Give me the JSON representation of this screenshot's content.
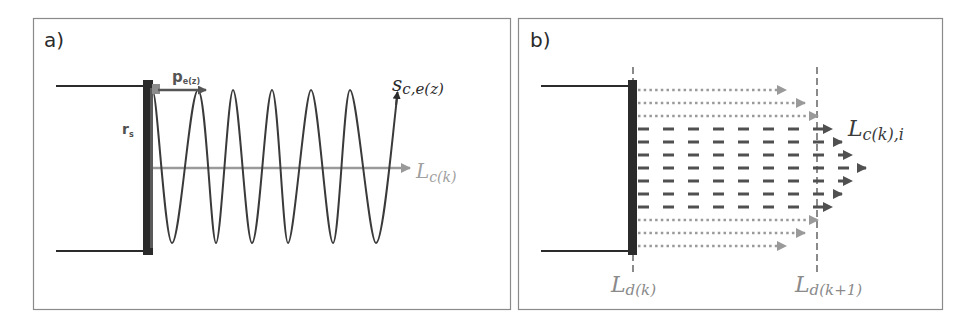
{
  "colors": {
    "dark": "#2b2b2b",
    "mid": "#505050",
    "light": "#9a9a9a",
    "border": "#8a8a8a",
    "pe_arrow": "#555555",
    "pe_marker": "#8c8c8c"
  },
  "panel_a": {
    "label": "a)",
    "rs_label": "r",
    "rs_sub": "s",
    "pe_label": "p",
    "pe_sub": "e(z)",
    "wave_label_main": "s",
    "wave_label_sub": "c,e(z)",
    "axis_label_main": "L",
    "axis_label_sub": "c(k)"
  },
  "panel_b": {
    "label": "b)",
    "ray_label_main": "L",
    "ray_label_sub": "c(k),i",
    "d_k_label_main": "L",
    "d_k_label_sub": "d(k)",
    "d_k1_label_main": "L",
    "d_k1_label_sub": "d(k+1)"
  }
}
